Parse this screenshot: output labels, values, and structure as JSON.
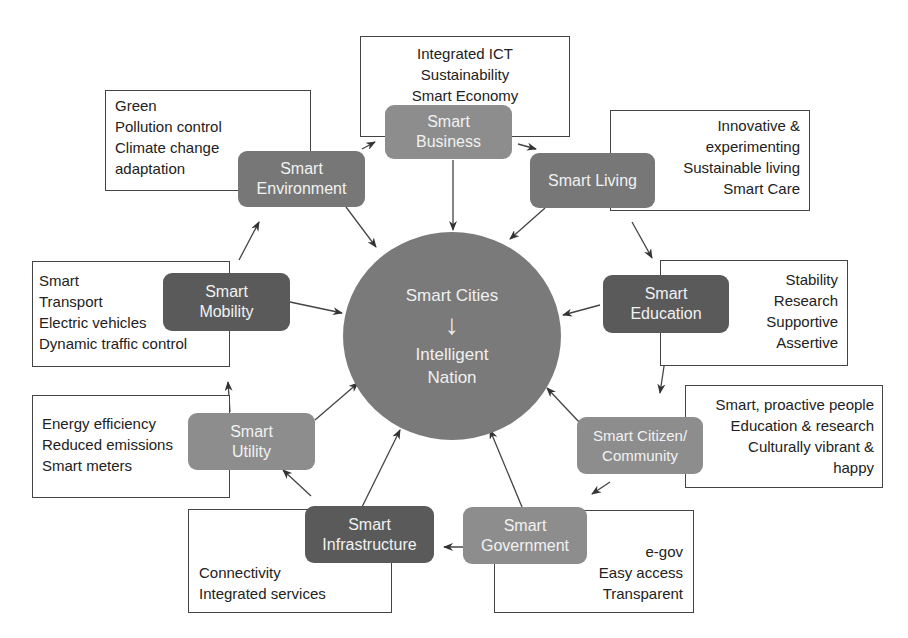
{
  "center": {
    "title": "Smart Cities",
    "arrow": "↓",
    "subtitle_line1": "Intelligent",
    "subtitle_line2": "Nation"
  },
  "nodes": {
    "business": {
      "line1": "Smart",
      "line2": "Business",
      "details": [
        "Integrated ICT",
        "Sustainability",
        "Smart Economy"
      ]
    },
    "living": {
      "line1": "Smart Living",
      "details": [
        "Innovative &",
        "experimenting",
        "Sustainable living",
        "Smart Care"
      ]
    },
    "education": {
      "line1": "Smart",
      "line2": "Education",
      "details": [
        "Stability",
        "Research",
        "Supportive",
        "Assertive"
      ]
    },
    "citizen": {
      "line1": "Smart Citizen/",
      "line2": "Community",
      "details": [
        "Smart, proactive people",
        "Education & research",
        "Culturally vibrant &",
        "happy"
      ]
    },
    "government": {
      "line1": "Smart",
      "line2": "Government",
      "details": [
        "e-gov",
        "Easy access",
        "Transparent"
      ]
    },
    "infrastructure": {
      "line1": "Smart",
      "line2": "Infrastructure",
      "details": [
        "Connectivity",
        "Integrated services"
      ]
    },
    "utility": {
      "line1": "Smart",
      "line2": "Utility",
      "details": [
        "Energy efficiency",
        "Reduced emissions",
        "Smart meters"
      ]
    },
    "mobility": {
      "line1": "Smart",
      "line2": "Mobility",
      "details": [
        "Smart",
        "Transport",
        "Electric vehicles",
        "Dynamic traffic control"
      ]
    },
    "environment": {
      "line1": "Smart",
      "line2": "Environment",
      "details": [
        "Green",
        "Pollution control",
        "Climate change",
        "adaptation"
      ]
    }
  },
  "colors": {
    "dark_node": "#5a5a5a",
    "mid_node": "#777777",
    "light_node": "#8d8d8d",
    "circle": "#7a7a7a",
    "line": "#444444"
  }
}
